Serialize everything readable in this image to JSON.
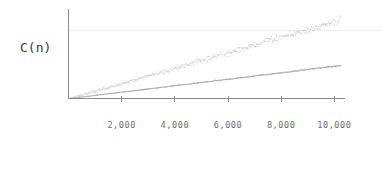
{
  "chart_data": {
    "type": "scatter",
    "title": "",
    "subtitle": "",
    "xlabel": "",
    "ylabel": "C(n)",
    "grid": "faint-horizontal",
    "legend": "none",
    "xlim": [
      0,
      10400
    ],
    "ylim": [
      0,
      100000
    ],
    "xticks": [
      2000,
      4000,
      6000,
      8000,
      10000
    ],
    "xticklabels": [
      "2,000",
      "4,000",
      "6,000",
      "8,000",
      "10,000"
    ],
    "yticks": [],
    "yticklabels": [],
    "annotations": [],
    "series": [
      {
        "name": "upper-series",
        "marker": "dot",
        "color": "#b9b9c0",
        "noise": 0.055,
        "density": 520,
        "slope": 8.55,
        "curvature": 0.12,
        "x_start": 0,
        "x_end": 10250,
        "y_at_x_end": 88000,
        "note": "steeper, diffuse cloud of points"
      },
      {
        "name": "lower-series",
        "marker": "dot",
        "color": "#9a9aa2",
        "noise": 0.022,
        "density": 560,
        "slope": 3.55,
        "curvature": 0.06,
        "x_start": 0,
        "x_end": 10250,
        "y_at_x_end": 37000,
        "note": "shallower, tight narrow band"
      }
    ]
  },
  "axes": {
    "y_axis_label": "C(n)",
    "x_axis_color": "#8c8c8c",
    "y_axis_color": "#8c8c8c",
    "gridline_color": "#f0f0f2",
    "background_color": "#ffffff"
  }
}
